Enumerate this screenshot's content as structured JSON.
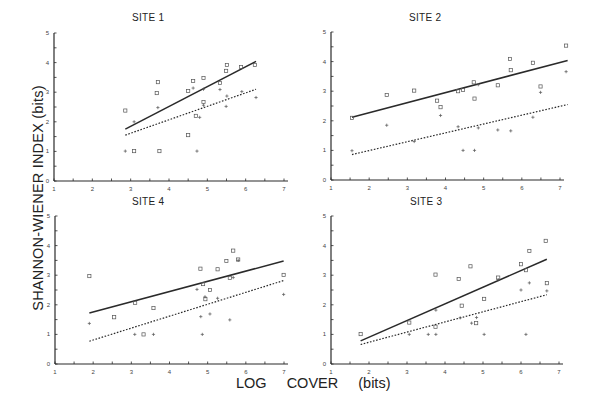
{
  "figure": {
    "ylabel": "SHANNON-WIENER INDEX (bits)",
    "xlabel": "LOG COVER (bits)"
  },
  "chart_data": [
    {
      "type": "scatter",
      "title": "SITE 1",
      "xlabel": "LOG COVER (bits)",
      "ylabel": "SHANNON-WIENER INDEX (bits)",
      "xlim": [
        1,
        7
      ],
      "ylim": [
        0,
        5
      ],
      "xticks": [
        1,
        2,
        3,
        4,
        5,
        6,
        7
      ],
      "yticks": [
        0,
        1,
        2,
        3,
        4,
        5
      ],
      "grid": false,
      "frame": {
        "x0": 54,
        "y0": 181,
        "x1": 284,
        "y1": 33,
        "title_x": 152,
        "title_y": 18
      },
      "series": [
        {
          "name": "squares",
          "marker": "square",
          "points": [
            [
              2.86,
              2.38
            ],
            [
              3.71,
              3.34
            ],
            [
              3.68,
              2.97
            ],
            [
              4.5,
              3.04
            ],
            [
              4.63,
              3.38
            ],
            [
              4.9,
              3.48
            ],
            [
              4.9,
              2.67
            ],
            [
              4.7,
              2.2
            ],
            [
              5.33,
              3.31
            ],
            [
              5.49,
              3.72
            ],
            [
              5.51,
              3.92
            ],
            [
              5.88,
              3.85
            ],
            [
              6.24,
              3.92
            ],
            [
              3.09,
              1.01
            ],
            [
              3.75,
              1.01
            ],
            [
              4.5,
              1.55
            ]
          ]
        },
        {
          "name": "pluses",
          "marker": "plus",
          "points": [
            [
              2.86,
              1.01
            ],
            [
              3.09,
              2.0
            ],
            [
              3.71,
              2.48
            ],
            [
              4.63,
              3.14
            ],
            [
              4.9,
              3.1
            ],
            [
              4.9,
              2.56
            ],
            [
              5.33,
              3.09
            ],
            [
              5.51,
              2.87
            ],
            [
              5.49,
              2.52
            ],
            [
              5.9,
              3.02
            ],
            [
              6.27,
              2.82
            ],
            [
              4.73,
              1.01
            ],
            [
              4.8,
              2.15
            ]
          ]
        }
      ],
      "fit_lines": [
        {
          "name": "squares-fit",
          "style": "solid",
          "from": [
            2.86,
            1.75
          ],
          "to": [
            6.27,
            4.04
          ]
        },
        {
          "name": "pluses-fit",
          "style": "dotted",
          "from": [
            2.86,
            1.55
          ],
          "to": [
            6.27,
            3.1
          ]
        }
      ]
    },
    {
      "type": "scatter",
      "title": "SITE 2",
      "xlabel": "LOG COVER (bits)",
      "ylabel": "SHANNON-WIENER INDEX (bits)",
      "xlim": [
        1,
        7
      ],
      "ylim": [
        0,
        5
      ],
      "xticks": [
        1,
        2,
        3,
        4,
        5,
        6,
        7
      ],
      "yticks": [
        0,
        1,
        2,
        3,
        4,
        5
      ],
      "grid": false,
      "frame": {
        "x0": 331,
        "y0": 180,
        "x1": 560,
        "y1": 32,
        "title_x": 428,
        "title_y": 18
      },
      "series": [
        {
          "name": "squares",
          "marker": "square",
          "points": [
            [
              1.55,
              2.1
            ],
            [
              2.46,
              2.87
            ],
            [
              3.18,
              3.02
            ],
            [
              3.78,
              2.68
            ],
            [
              3.87,
              2.46
            ],
            [
              4.33,
              3.0
            ],
            [
              4.46,
              3.04
            ],
            [
              4.74,
              3.3
            ],
            [
              4.76,
              2.75
            ],
            [
              5.37,
              3.2
            ],
            [
              5.69,
              4.09
            ],
            [
              5.71,
              3.71
            ],
            [
              6.29,
              3.96
            ],
            [
              6.49,
              3.16
            ],
            [
              7.16,
              4.54
            ]
          ]
        },
        {
          "name": "pluses",
          "marker": "plus",
          "points": [
            [
              1.55,
              0.99
            ],
            [
              2.46,
              1.85
            ],
            [
              3.18,
              1.3
            ],
            [
              3.87,
              2.18
            ],
            [
              4.33,
              1.8
            ],
            [
              4.46,
              1.0
            ],
            [
              4.76,
              1.0
            ],
            [
              4.86,
              1.76
            ],
            [
              4.86,
              3.22
            ],
            [
              5.37,
              1.69
            ],
            [
              5.71,
              1.66
            ],
            [
              6.29,
              2.12
            ],
            [
              6.49,
              2.96
            ],
            [
              7.16,
              3.66
            ]
          ]
        }
      ],
      "fit_lines": [
        {
          "name": "squares-fit",
          "style": "solid",
          "from": [
            1.55,
            2.12
          ],
          "to": [
            7.2,
            4.04
          ]
        },
        {
          "name": "pluses-fit",
          "style": "dotted",
          "from": [
            1.55,
            0.86
          ],
          "to": [
            7.2,
            2.55
          ]
        }
      ]
    },
    {
      "type": "scatter",
      "title": "SITE 4",
      "xlabel": "LOG COVER (bits)",
      "ylabel": "SHANNON-WIENER INDEX (bits)",
      "xlim": [
        1,
        7
      ],
      "ylim": [
        0,
        5
      ],
      "xticks": [
        1,
        2,
        3,
        4,
        5,
        6,
        7
      ],
      "yticks": [
        0,
        1,
        2,
        3,
        4,
        5
      ],
      "grid": false,
      "frame": {
        "x0": 55,
        "y0": 364,
        "x1": 284,
        "y1": 216,
        "title_x": 152,
        "title_y": 202
      },
      "series": [
        {
          "name": "squares",
          "marker": "square",
          "points": [
            [
              1.9,
              2.97
            ],
            [
              2.55,
              1.58
            ],
            [
              3.1,
              2.07
            ],
            [
              3.58,
              1.89
            ],
            [
              4.81,
              3.22
            ],
            [
              4.88,
              2.7
            ],
            [
              5.06,
              2.5
            ],
            [
              4.94,
              2.19
            ],
            [
              5.26,
              3.2
            ],
            [
              5.49,
              3.48
            ],
            [
              5.58,
              2.91
            ],
            [
              5.67,
              3.83
            ],
            [
              5.8,
              3.53
            ],
            [
              6.99,
              3.01
            ],
            [
              3.32,
              1.0
            ]
          ]
        },
        {
          "name": "pluses",
          "marker": "plus",
          "points": [
            [
              1.9,
              1.37
            ],
            [
              3.09,
              1.0
            ],
            [
              3.58,
              1.0
            ],
            [
              4.72,
              2.52
            ],
            [
              4.82,
              1.6
            ],
            [
              4.86,
              1.0
            ],
            [
              4.93,
              2.27
            ],
            [
              5.06,
              1.69
            ],
            [
              5.26,
              2.22
            ],
            [
              5.58,
              1.49
            ],
            [
              5.67,
              2.92
            ],
            [
              5.8,
              3.5
            ],
            [
              6.99,
              2.35
            ]
          ]
        }
      ],
      "fit_lines": [
        {
          "name": "squares-fit",
          "style": "solid",
          "from": [
            1.9,
            1.72
          ],
          "to": [
            6.99,
            3.48
          ]
        },
        {
          "name": "pluses-fit",
          "style": "dotted",
          "from": [
            1.9,
            0.77
          ],
          "to": [
            6.99,
            2.82
          ]
        }
      ]
    },
    {
      "type": "scatter",
      "title": "SITE 3",
      "xlabel": "LOG COVER (bits)",
      "ylabel": "SHANNON-WIENER INDEX (bits)",
      "xlim": [
        1,
        7
      ],
      "ylim": [
        0,
        5
      ],
      "xticks": [
        1,
        2,
        3,
        4,
        5,
        6,
        7
      ],
      "yticks": [
        0,
        1,
        2,
        3,
        4,
        5
      ],
      "grid": false,
      "frame": {
        "x0": 331,
        "y0": 364,
        "x1": 559,
        "y1": 216,
        "title_x": 430,
        "title_y": 202
      },
      "series": [
        {
          "name": "squares",
          "marker": "square",
          "points": [
            [
              1.78,
              1.01
            ],
            [
              3.06,
              1.4
            ],
            [
              3.75,
              3.02
            ],
            [
              3.75,
              1.26
            ],
            [
              4.36,
              2.87
            ],
            [
              4.44,
              1.97
            ],
            [
              4.67,
              3.3
            ],
            [
              4.82,
              1.38
            ],
            [
              5.03,
              2.2
            ],
            [
              5.4,
              2.92
            ],
            [
              6.0,
              3.37
            ],
            [
              6.13,
              3.17
            ],
            [
              6.22,
              3.82
            ],
            [
              6.65,
              4.16
            ],
            [
              6.68,
              2.73
            ]
          ]
        },
        {
          "name": "pluses",
          "marker": "plus",
          "points": [
            [
              3.06,
              1.0
            ],
            [
              3.56,
              1.0
            ],
            [
              3.76,
              1.0
            ],
            [
              3.76,
              1.82
            ],
            [
              4.4,
              1.56
            ],
            [
              4.7,
              1.38
            ],
            [
              4.83,
              1.57
            ],
            [
              5.03,
              1.0
            ],
            [
              5.4,
              2.85
            ],
            [
              6.0,
              2.5
            ],
            [
              6.13,
              1.0
            ],
            [
              6.22,
              2.74
            ],
            [
              6.68,
              2.47
            ]
          ]
        }
      ],
      "fit_lines": [
        {
          "name": "squares-fit",
          "style": "solid",
          "from": [
            1.78,
            0.78
          ],
          "to": [
            6.68,
            3.54
          ]
        },
        {
          "name": "pluses-fit",
          "style": "dotted",
          "from": [
            1.78,
            0.66
          ],
          "to": [
            6.68,
            2.34
          ]
        }
      ]
    }
  ]
}
